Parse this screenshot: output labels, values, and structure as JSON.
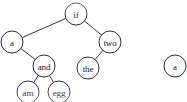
{
  "diagram": {
    "type": "binary-tree",
    "title": "",
    "node_radius": 11,
    "line_color": "#3a3a3a",
    "node_fill": "#ffffff",
    "node_stroke": "#2e2e2e",
    "text_color": "#161616",
    "nodes": [
      {
        "id": "if",
        "label": "if",
        "cx": 76,
        "cy": 14
      },
      {
        "id": "a",
        "label": "a",
        "cx": 12,
        "cy": 42
      },
      {
        "id": "two",
        "label": "two",
        "cx": 110,
        "cy": 42
      },
      {
        "id": "and",
        "label": "and",
        "cx": 44,
        "cy": 66
      },
      {
        "id": "the",
        "label": "the",
        "cx": 88,
        "cy": 68
      },
      {
        "id": "am",
        "label": "am",
        "cx": 28,
        "cy": 92
      },
      {
        "id": "egg",
        "label": "egg",
        "cx": 59,
        "cy": 92
      },
      {
        "id": "a2",
        "label": "a",
        "cx": 175,
        "cy": 66
      }
    ],
    "edges": [
      {
        "from": "if",
        "to": "a"
      },
      {
        "from": "if",
        "to": "two"
      },
      {
        "from": "a",
        "to": "and"
      },
      {
        "from": "two",
        "to": "the"
      },
      {
        "from": "and",
        "to": "am"
      },
      {
        "from": "and",
        "to": "egg"
      }
    ],
    "root": "if",
    "secondary_root": "a2",
    "secondary_note": "partially cropped node at right edge"
  }
}
